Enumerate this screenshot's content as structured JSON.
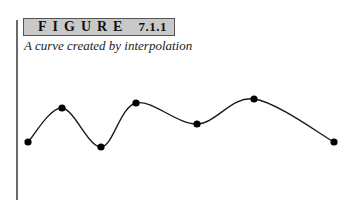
{
  "figure": {
    "label_word": "FIGURE",
    "label_number": "7.1.1",
    "caption": "A curve created by interpolation"
  },
  "colors": {
    "label_background": "#c9c9c9",
    "label_border": "#555555",
    "curve": "#1a1a1a",
    "points": "#000000",
    "rule": "#6a6a6a"
  },
  "diagram": {
    "type": "interpolated-curve",
    "points": [
      {
        "x": 28,
        "y": 142
      },
      {
        "x": 62,
        "y": 108
      },
      {
        "x": 101,
        "y": 147
      },
      {
        "x": 136,
        "y": 103
      },
      {
        "x": 197,
        "y": 124
      },
      {
        "x": 254,
        "y": 99
      },
      {
        "x": 334,
        "y": 142
      }
    ]
  }
}
